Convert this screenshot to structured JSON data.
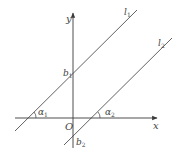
{
  "diagram": {
    "type": "coordinate-geometry",
    "axes": {
      "x_label": "x",
      "y_label": "y",
      "origin_label": "O"
    },
    "lines": [
      {
        "name": "l",
        "subscript": "1",
        "intercept_label": "b",
        "intercept_sub": "1",
        "angle_label": "α",
        "angle_sub": "1"
      },
      {
        "name": "l",
        "subscript": "2",
        "intercept_label": "b",
        "intercept_sub": "2",
        "angle_label": "α",
        "angle_sub": "2"
      }
    ],
    "colors": {
      "stroke": "#3a3a3a",
      "text": "#444444",
      "background": "#ffffff"
    }
  }
}
